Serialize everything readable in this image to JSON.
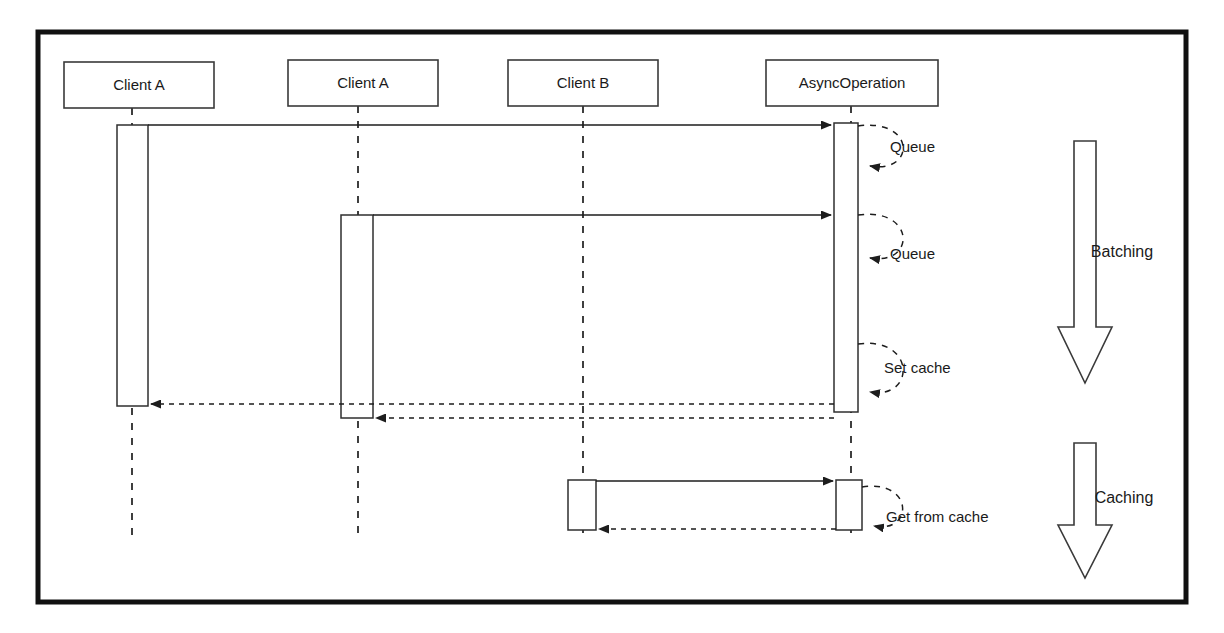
{
  "diagram": {
    "type": "uml-sequence-diagram",
    "frame": {
      "x": 38,
      "y": 32,
      "width": 1148,
      "height": 570,
      "stroke": "#111111"
    },
    "colors": {
      "line": "#1d1d1d",
      "box_stroke": "#3a3a3a",
      "background": "#ffffff",
      "text": "#1a1a1a"
    },
    "participants": [
      {
        "id": "clientA1",
        "label": "Client A",
        "x": 132,
        "box_x": 64,
        "box_y": 62,
        "box_w": 150,
        "box_h": 46
      },
      {
        "id": "clientA2",
        "label": "Client A",
        "x": 358,
        "box_x": 288,
        "box_y": 60,
        "box_w": 150,
        "box_h": 46
      },
      {
        "id": "clientB",
        "label": "Client B",
        "x": 583,
        "box_x": 508,
        "box_y": 60,
        "box_w": 150,
        "box_h": 46
      },
      {
        "id": "asyncOp",
        "label": "AsyncOperation",
        "x": 851,
        "box_x": 766,
        "box_y": 60,
        "box_w": 172,
        "box_h": 46
      }
    ],
    "lifeline_bottom": 537,
    "activations": [
      {
        "id": "act-clientA1",
        "participant": "clientA1",
        "x": 117,
        "y": 125,
        "width": 31,
        "height": 281
      },
      {
        "id": "act-clientA2",
        "participant": "clientA2",
        "x": 341,
        "y": 215,
        "width": 32,
        "height": 203
      },
      {
        "id": "act-asyncOp-batch",
        "participant": "asyncOp",
        "x": 834,
        "y": 123,
        "width": 24,
        "height": 289
      },
      {
        "id": "act-clientB",
        "participant": "clientB",
        "x": 568,
        "y": 480,
        "width": 28,
        "height": 50
      },
      {
        "id": "act-asyncOp-cache",
        "participant": "asyncOp",
        "x": 836,
        "y": 480,
        "width": 26,
        "height": 50
      }
    ],
    "messages": [
      {
        "id": "m1",
        "kind": "call",
        "label": "",
        "from": "clientA1",
        "to": "asyncOp",
        "x1": 148,
        "x2": 831,
        "y": 125
      },
      {
        "id": "m2",
        "kind": "call",
        "label": "",
        "from": "clientA2",
        "to": "asyncOp",
        "x1": 373,
        "x2": 831,
        "y": 215
      },
      {
        "id": "m3",
        "kind": "return",
        "label": "",
        "from": "asyncOp",
        "to": "clientA1",
        "x1": 834,
        "x2": 151,
        "y": 404
      },
      {
        "id": "m4",
        "kind": "return",
        "label": "",
        "from": "asyncOp",
        "to": "clientA2",
        "x1": 834,
        "x2": 376,
        "y": 418
      },
      {
        "id": "m5",
        "kind": "call",
        "label": "",
        "from": "clientB",
        "to": "asyncOp",
        "x1": 596,
        "x2": 833,
        "y": 481
      },
      {
        "id": "m6",
        "kind": "return",
        "label": "",
        "from": "asyncOp",
        "to": "clientB",
        "x1": 836,
        "x2": 599,
        "y": 529
      }
    ],
    "self_messages": [
      {
        "id": "s1",
        "label": "Queue",
        "participant": "asyncOp",
        "start_x": 858,
        "start_y": 126,
        "end_y": 166,
        "bulge": 58,
        "label_x": 890,
        "label_y": 148
      },
      {
        "id": "s2",
        "label": "Queue",
        "participant": "asyncOp",
        "start_x": 858,
        "start_y": 215,
        "end_y": 258,
        "bulge": 58,
        "label_x": 890,
        "label_y": 255
      },
      {
        "id": "s3",
        "label": "Set cache",
        "participant": "asyncOp",
        "start_x": 858,
        "start_y": 344,
        "end_y": 392,
        "bulge": 58,
        "label_x": 884,
        "label_y": 369
      },
      {
        "id": "s4",
        "label": "Get from cache",
        "participant": "asyncOp",
        "start_x": 862,
        "start_y": 487,
        "end_y": 526,
        "bulge": 52,
        "label_x": 886,
        "label_y": 518
      }
    ],
    "phases": [
      {
        "id": "phase-batching",
        "label": "Batching",
        "label_x": 1122,
        "label_y": 253,
        "arrow_x": 1085,
        "arrow_top": 141,
        "arrow_bottom": 383,
        "shaft_half_width": 11,
        "head_half_width": 27,
        "head_height": 56
      },
      {
        "id": "phase-caching",
        "label": "Caching",
        "label_x": 1124,
        "label_y": 499,
        "arrow_x": 1085,
        "arrow_top": 443,
        "arrow_bottom": 578,
        "shaft_half_width": 11,
        "head_half_width": 27,
        "head_height": 53
      }
    ]
  }
}
